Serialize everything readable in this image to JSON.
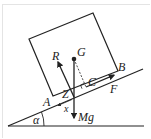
{
  "diagram": {
    "colors": {
      "ink": "#222222",
      "frame": "#e4e4e4",
      "background": "#ffffff"
    },
    "labels": {
      "R": "R",
      "G": "G",
      "B": "B",
      "C": "C",
      "F": "F",
      "Z": "Z",
      "A": "A",
      "x": "x",
      "Mg": "Mg",
      "alpha": "α"
    },
    "elements": {
      "block": "rectangular block resting on incline",
      "incline": "inclined plane at angle alpha",
      "ground": "horizontal ground line",
      "force_R": "normal reaction R acting at Z",
      "force_Mg": "weight Mg acting vertically down through G",
      "force_F": "friction F along incline",
      "perpendicular_GC": "dashed perpendicular from G to incline at C with right-angle mark",
      "distance_x": "distance x from A to Z"
    }
  }
}
